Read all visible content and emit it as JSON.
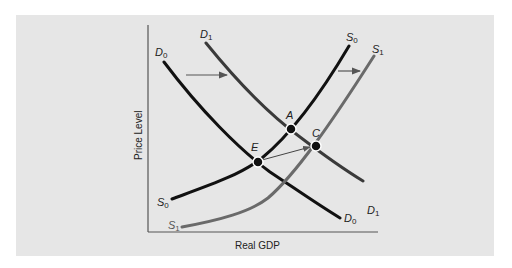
{
  "diagram": {
    "type": "aggregate supply and demand shift diagram",
    "axes": {
      "x_label": "Real GDP",
      "y_label": "Price Level"
    },
    "curves": [
      {
        "id": "D0",
        "base": "D",
        "sub": "0",
        "kind": "demand",
        "color": "#111111"
      },
      {
        "id": "D1",
        "base": "D",
        "sub": "1",
        "kind": "demand",
        "color": "#3a3a3a"
      },
      {
        "id": "S0",
        "base": "S",
        "sub": "0",
        "kind": "supply",
        "color": "#111111"
      },
      {
        "id": "S1",
        "base": "S",
        "sub": "1",
        "kind": "supply",
        "color": "#6a6a6a"
      }
    ],
    "points": [
      {
        "label": "E",
        "description": "intersection of D0 and S0"
      },
      {
        "label": "A",
        "description": "intersection of D1 and S0"
      },
      {
        "label": "C",
        "description": "intersection of D1 and S1"
      }
    ],
    "arrows": [
      {
        "description": "demand shifts right from D0 to D1"
      },
      {
        "description": "supply shifts right from S0 to S1"
      },
      {
        "description": "equilibrium moves from E to C"
      }
    ]
  },
  "labels": {
    "x_axis": "Real GDP",
    "y_axis": "Price Level",
    "D0_top": "D",
    "D0_top_sub": "0",
    "D0_end": "D",
    "D0_end_sub": "0",
    "D1_top": "D",
    "D1_top_sub": "1",
    "D1_end": "D",
    "D1_end_sub": "1",
    "S0_start": "S",
    "S0_start_sub": "0",
    "S0_top": "S",
    "S0_top_sub": "0",
    "S1_start": "S",
    "S1_start_sub": "1",
    "S1_top": "S",
    "S1_top_sub": "1",
    "point_E": "E",
    "point_A": "A",
    "point_C": "C"
  },
  "colors": {
    "panel_bg": "#e6e6e6",
    "axis": "#555555",
    "curve_dark": "#111111",
    "curve_d1": "#3a3a3a",
    "curve_s1": "#6a6a6a",
    "arrow": "#555555"
  }
}
